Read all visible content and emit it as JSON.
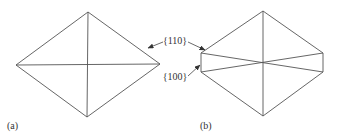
{
  "figure": {
    "panels": [
      {
        "id": "a",
        "label": "(a)"
      },
      {
        "id": "b",
        "label": "(b)"
      }
    ],
    "annotations": {
      "face_110": "{110}",
      "face_100": "{100}"
    },
    "colors": {
      "line": "#555555",
      "text": "#333333",
      "background": "#ffffff"
    }
  }
}
